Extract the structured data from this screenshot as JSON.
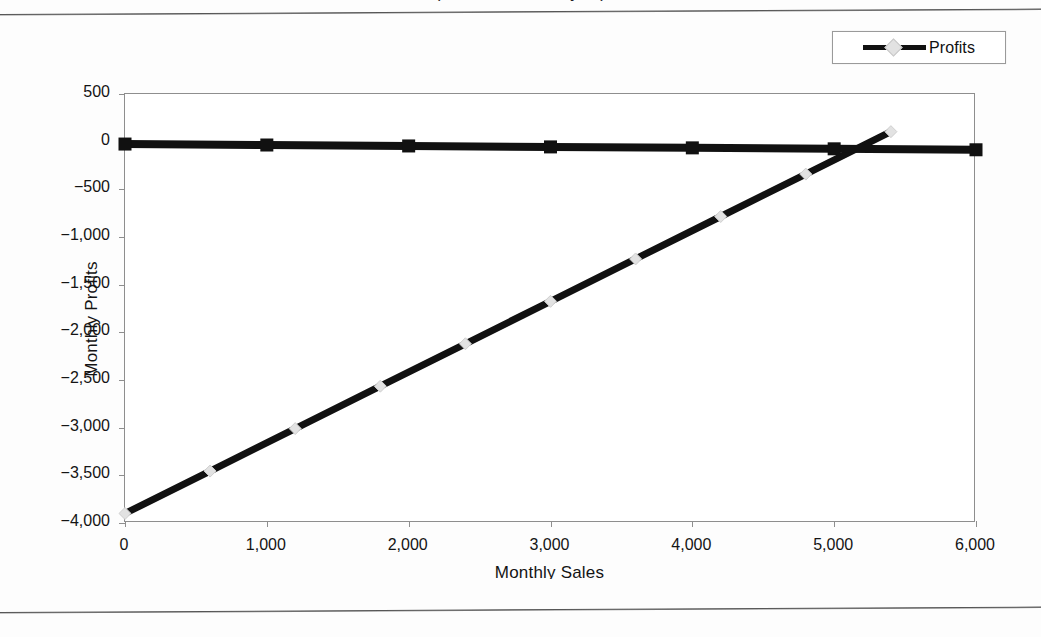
{
  "figure": {
    "title_clipped": "(Break-Even Analysis)",
    "note": "scanned textbook figure"
  },
  "legend": {
    "position": "top-right",
    "entries": [
      {
        "label": "Profits",
        "line_color": "#111111",
        "marker": "diamond",
        "marker_color": "#e2e2e2"
      }
    ]
  },
  "axes": {
    "x_title": "Monthly Sales",
    "y_title": "Monthly Profits",
    "x_ticks": [
      "0",
      "1,000",
      "2,000",
      "3,000",
      "4,000",
      "5,000",
      "6,000"
    ],
    "y_ticks": [
      "500",
      "0",
      "−500",
      "−1,000",
      "−1,500",
      "−2,000",
      "−2,500",
      "−3,000",
      "−3,500",
      "−4,000"
    ]
  },
  "chart_data": {
    "type": "line",
    "title": "(Break-Even Analysis)",
    "xlabel": "Monthly Sales",
    "ylabel": "Monthly Profits",
    "xlim": [
      0,
      6000
    ],
    "ylim": [
      -4000,
      500
    ],
    "xticks": [
      0,
      1000,
      2000,
      3000,
      4000,
      5000,
      6000
    ],
    "yticks": [
      500,
      0,
      -500,
      -1000,
      -1500,
      -2000,
      -2500,
      -3000,
      -3500,
      -4000
    ],
    "grid": false,
    "legend_position": "top-right",
    "break_even_x": 5150,
    "series": [
      {
        "name": "Profits",
        "marker": "diamond",
        "marker_color": "#e2e2e2",
        "line_color": "#111111",
        "x": [
          0,
          600,
          1200,
          1800,
          2400,
          3000,
          3600,
          4200,
          4800,
          5400
        ],
        "values": [
          -3900,
          -3455,
          -3010,
          -2565,
          -2120,
          -1675,
          -1230,
          -785,
          -340,
          105
        ]
      },
      {
        "name": "Zero Reference",
        "marker": "square",
        "marker_color": "#111111",
        "line_color": "#111111",
        "x": [
          0,
          1000,
          2000,
          3000,
          4000,
          5000,
          6000
        ],
        "values": [
          -25,
          -35,
          -45,
          -55,
          -65,
          -75,
          -85
        ]
      }
    ]
  }
}
